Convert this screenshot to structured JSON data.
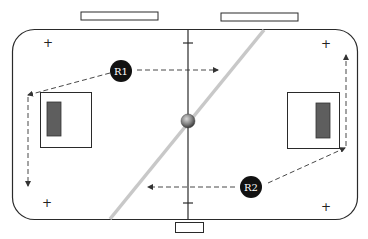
{
  "diagram": {
    "title": "",
    "colors": {
      "outline": "#2a2a2a",
      "diagonal": "#c8c8c8",
      "marker_fill": "#111111",
      "marker_text": "#ffffff",
      "inner_rect": "#5e5e5e",
      "ball": "#8a8a8a"
    },
    "markers": [
      {
        "id": "R1",
        "label": "R1"
      },
      {
        "id": "R2",
        "label": "R2"
      }
    ],
    "plus_signs": [
      "+",
      "+",
      "+",
      "+"
    ],
    "elements": {
      "outer_field": "rounded-rectangle",
      "top_boxes": 2,
      "bottom_box": 1,
      "center_line": "vertical",
      "center_ball": "sphere",
      "diagonal_line": "gray",
      "side_squares": 2
    }
  }
}
